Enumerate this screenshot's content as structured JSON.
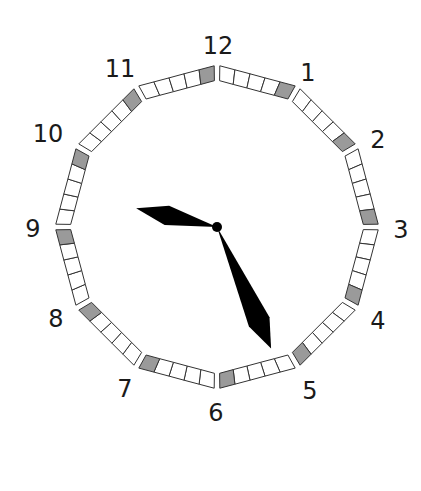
{
  "clock": {
    "center": [
      217,
      227
    ],
    "inner_radius": 147,
    "outer_radius": 162,
    "squares_per_hour": 5,
    "highlight_index": 4,
    "colors": {
      "square_fill": "#ffffff",
      "highlight_fill": "#9a9a9a",
      "stroke": "#333333",
      "hand": "#000000"
    },
    "hour_labels": [
      {
        "text": "12",
        "x": 218,
        "y": 54
      },
      {
        "text": "1",
        "x": 308,
        "y": 81
      },
      {
        "text": "2",
        "x": 378,
        "y": 148
      },
      {
        "text": "3",
        "x": 401,
        "y": 238
      },
      {
        "text": "4",
        "x": 378,
        "y": 329
      },
      {
        "text": "5",
        "x": 310,
        "y": 399
      },
      {
        "text": "6",
        "x": 216,
        "y": 421
      },
      {
        "text": "7",
        "x": 125,
        "y": 397
      },
      {
        "text": "8",
        "x": 56,
        "y": 327
      },
      {
        "text": "9",
        "x": 33,
        "y": 237
      },
      {
        "text": "10",
        "x": 48,
        "y": 142
      },
      {
        "text": "11",
        "x": 120,
        "y": 77
      }
    ],
    "time_shown": "9:26",
    "hour_hand": {
      "angle_deg": 283,
      "length": 83
    },
    "minute_hand": {
      "angle_deg": 156,
      "length": 133
    }
  }
}
